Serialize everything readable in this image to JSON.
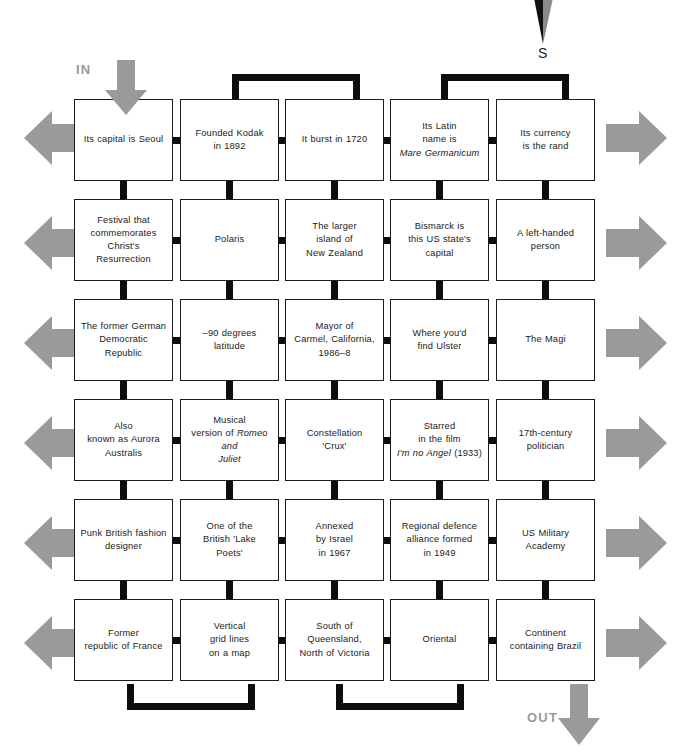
{
  "puzzle": {
    "title": "Codeword grid puzzle",
    "compass": {
      "label": "S",
      "icon": "compass-needle-icon"
    },
    "in_label": "IN",
    "out_label": "OUT",
    "colors": {
      "arrow_gray": "#9a9a9a",
      "connector_black": "#0d0d0d",
      "box_border": "#1b1b1b",
      "text": "#1a1a1a",
      "background": "#ffffff"
    },
    "grid": {
      "rows": 6,
      "cols": 5,
      "cells": [
        [
          {
            "text": "Its capital is Seoul",
            "html": "Its capital is Seoul"
          },
          {
            "text": "Founded Kodak in 1892",
            "html": "Founded Kodak<br>in 1892"
          },
          {
            "text": "It burst in 1720",
            "html": "It burst in 1720"
          },
          {
            "text": "Its Latin name is Mare Germanicum",
            "html": "Its Latin<br>name is<br><i>Mare Germanicum</i>"
          },
          {
            "text": "Its currency is the rand",
            "html": "Its currency<br>is the rand"
          }
        ],
        [
          {
            "text": "Festival that commemorates Christ's Resurrection",
            "html": "Festival that<br>commemorates<br>Christ's<br>Resurrection"
          },
          {
            "text": "Polaris",
            "html": "Polaris"
          },
          {
            "text": "The larger island of New Zealand",
            "html": "The larger<br>island of<br>New Zealand"
          },
          {
            "text": "Bismarck is this US state's capital",
            "html": "Bismarck is<br>this US state's<br>capital"
          },
          {
            "text": "A left-handed person",
            "html": "A left-handed<br>person"
          }
        ],
        [
          {
            "text": "The former German Democratic Republic",
            "html": "The former German<br>Democratic Republic"
          },
          {
            "text": "–90 degrees latitude",
            "html": "–90 degrees latitude"
          },
          {
            "text": "Mayor of Carmel, California, 1986–8",
            "html": "Mayor of<br>Carmel, California,<br>1986–8"
          },
          {
            "text": "Where you'd find Ulster",
            "html": "Where you'd<br>find Ulster"
          },
          {
            "text": "The Magi",
            "html": "The Magi"
          }
        ],
        [
          {
            "text": "Also known as Aurora Australis",
            "html": "Also<br>known as Aurora<br>Australis"
          },
          {
            "text": "Musical version of Romeo and Juliet",
            "html": "Musical<br>version of <i>Romeo and</i><br><i>Juliet</i>"
          },
          {
            "text": "Constellation 'Crux'",
            "html": "Constellation<br>'Crux'"
          },
          {
            "text": "Starred in the film I'm no Angel (1933)",
            "html": "Starred<br>in the film<br><i>I'm no Angel</i> (1933)"
          },
          {
            "text": "17th-century politician",
            "html": "17th-century<br>politician"
          }
        ],
        [
          {
            "text": "Punk British fashion designer",
            "html": "Punk British fashion<br>designer"
          },
          {
            "text": "One of the British 'Lake Poets'",
            "html": "One of the<br>British 'Lake<br>Poets'"
          },
          {
            "text": "Annexed by Israel in 1967",
            "html": "Annexed<br>by Israel<br>in 1967"
          },
          {
            "text": "Regional defence alliance formed in 1949",
            "html": "Regional defence<br>alliance formed<br>in 1949"
          },
          {
            "text": "US Military Academy",
            "html": "US Military<br>Academy"
          }
        ],
        [
          {
            "text": "Former republic of France",
            "html": "Former<br>republic of France"
          },
          {
            "text": "Vertical grid lines on a map",
            "html": "Vertical<br>grid lines<br>on a map"
          },
          {
            "text": "South of Queensland, North of Victoria",
            "html": "South of<br>Queensland,<br>North of Victoria"
          },
          {
            "text": "Oriental",
            "html": "Oriental"
          },
          {
            "text": "Continent containing Brazil",
            "html": "Continent<br>containing Brazil"
          }
        ]
      ]
    }
  }
}
